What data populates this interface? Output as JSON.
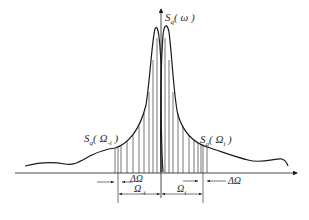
{
  "diagram": {
    "type": "spectrum-discretization",
    "y_axis_label": "Sq(ω)",
    "labels": {
      "axis": {
        "base": "S",
        "sub": "q",
        "arg": "ω"
      },
      "left_ordinate": {
        "base": "S",
        "sub": "q",
        "arg": "Ω",
        "arg_sub": "-i"
      },
      "right_ordinate": {
        "base": "S",
        "sub": "q",
        "arg": "Ω",
        "arg_sub": "i"
      },
      "delta_left": "ΔΩ",
      "delta_right": "ΔΩ",
      "omega_neg": {
        "base": "Ω",
        "sub": "-i"
      },
      "omega_pos": {
        "base": "Ω",
        "sub": "i"
      }
    },
    "colors": {
      "line": "#1a1a1a",
      "text": "#2b2b2b",
      "background": "#ffffff"
    }
  }
}
